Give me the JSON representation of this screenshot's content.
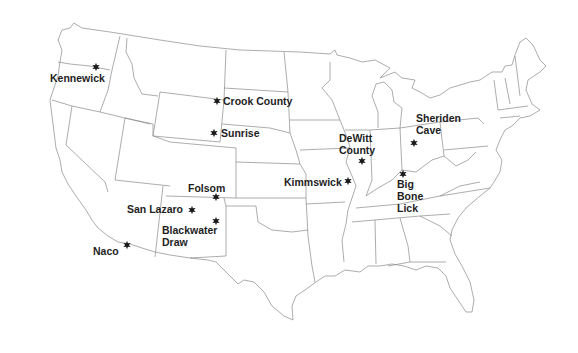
{
  "map": {
    "title": "",
    "region": "Contiguous United States",
    "marker_icon": "star-icon",
    "colors": {
      "land": "#ffffff",
      "borders": "#8a8a8a",
      "markers": "#1a1a1a",
      "labels": "#1e1e1e"
    },
    "sites": [
      {
        "id": "kennewick",
        "lines": [
          "Kennewick"
        ],
        "star": [
          96,
          67
        ],
        "label": [
          50,
          82
        ],
        "anchor": "start"
      },
      {
        "id": "crook-county",
        "lines": [
          "Crook County"
        ],
        "star": [
          217,
          101
        ],
        "label": [
          223,
          105
        ],
        "anchor": "start"
      },
      {
        "id": "sunrise",
        "lines": [
          "Sunrise"
        ],
        "star": [
          214,
          133
        ],
        "label": [
          221,
          137
        ],
        "anchor": "start"
      },
      {
        "id": "dewitt-county",
        "lines": [
          "DeWitt",
          "County"
        ],
        "star": [
          362,
          161
        ],
        "label": [
          339,
          142
        ],
        "anchor": "start"
      },
      {
        "id": "sheriden-cave",
        "lines": [
          "Sheriden",
          "Cave"
        ],
        "star": [
          414,
          143
        ],
        "label": [
          416,
          122
        ],
        "anchor": "start"
      },
      {
        "id": "kimmswick",
        "lines": [
          "Kimmswick"
        ],
        "star": [
          348,
          181
        ],
        "label": [
          284,
          186
        ],
        "anchor": "start"
      },
      {
        "id": "big-bone-lick",
        "lines": [
          "Big",
          "Bone",
          "Lick"
        ],
        "star": [
          403,
          174
        ],
        "label": [
          397,
          188
        ],
        "anchor": "start"
      },
      {
        "id": "folsom",
        "lines": [
          "Folsom"
        ],
        "star": [
          216,
          197
        ],
        "label": [
          188,
          192
        ],
        "anchor": "start"
      },
      {
        "id": "san-lazaro",
        "lines": [
          "San Lazaro"
        ],
        "star": [
          192,
          210
        ],
        "label": [
          127,
          213
        ],
        "anchor": "start"
      },
      {
        "id": "blackwater-draw",
        "lines": [
          "Blackwater",
          "Draw"
        ],
        "star": [
          216,
          221
        ],
        "label": [
          162,
          234
        ],
        "anchor": "start"
      },
      {
        "id": "naco",
        "lines": [
          "Naco"
        ],
        "star": [
          127,
          245
        ],
        "label": [
          93,
          255
        ],
        "anchor": "start"
      }
    ]
  }
}
